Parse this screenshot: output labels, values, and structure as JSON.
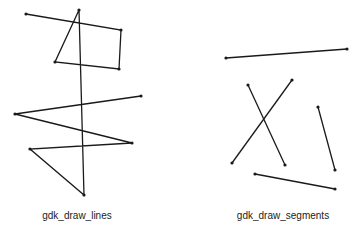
{
  "lines_demo": {
    "label": "gdk_draw_lines",
    "label_x": 77,
    "points": [
      [
        26,
        14
      ],
      [
        121,
        30
      ],
      [
        119,
        69
      ],
      [
        55,
        62
      ],
      [
        79,
        10
      ],
      [
        84,
        195
      ],
      [
        30,
        149
      ],
      [
        132,
        143
      ],
      [
        15,
        114
      ],
      [
        141,
        96
      ]
    ]
  },
  "segments_demo": {
    "label": "gdk_draw_segments",
    "label_x": 283,
    "segments": [
      [
        [
          226,
          58
        ],
        [
          347,
          49
        ]
      ],
      [
        [
          248,
          85
        ],
        [
          285,
          165
        ]
      ],
      [
        [
          292,
          80
        ],
        [
          232,
          163
        ]
      ],
      [
        [
          318,
          107
        ],
        [
          335,
          170
        ]
      ],
      [
        [
          255,
          174
        ],
        [
          335,
          189
        ]
      ]
    ]
  },
  "style": {
    "stroke": "#1a1a1a",
    "background": "#ffffff"
  }
}
